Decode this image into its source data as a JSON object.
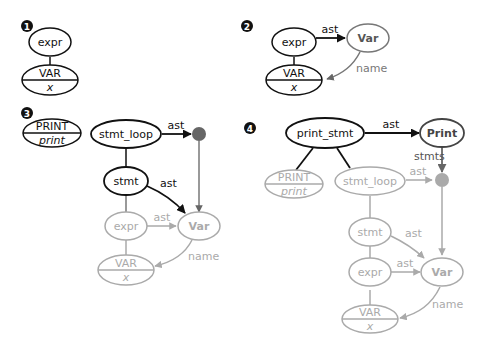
{
  "colors": {
    "black": "#111111",
    "dark_gray": "#666666",
    "light_gray": "#aaaaaa",
    "background": "#ffffff"
  },
  "panels": [
    {
      "step": "1",
      "nodes": [
        {
          "id": "expr",
          "label": "expr"
        },
        {
          "id": "VAR",
          "top": "VAR",
          "bottom": "x"
        }
      ]
    },
    {
      "step": "2",
      "nodes": [
        {
          "id": "expr",
          "label": "expr"
        },
        {
          "id": "Var",
          "label": "Var"
        },
        {
          "id": "VAR",
          "top": "VAR",
          "bottom": "x"
        }
      ],
      "edges": [
        {
          "from": "expr",
          "to": "Var",
          "label": "ast"
        },
        {
          "from": "Var",
          "to": "VAR",
          "label": "name"
        }
      ]
    },
    {
      "step": "3",
      "nodes": [
        {
          "id": "PRINT",
          "top": "PRINT",
          "bottom": "print"
        },
        {
          "id": "stmt_loop",
          "label": "stmt_loop"
        },
        {
          "id": "dot",
          "label": ""
        },
        {
          "id": "stmt",
          "label": "stmt"
        },
        {
          "id": "expr",
          "label": "expr"
        },
        {
          "id": "Var",
          "label": "Var"
        },
        {
          "id": "VAR",
          "top": "VAR",
          "bottom": "x"
        }
      ],
      "edges": [
        {
          "from": "stmt_loop",
          "to": "dot",
          "label": "ast"
        },
        {
          "from": "stmt",
          "to": "Var",
          "label": "ast"
        },
        {
          "from": "expr",
          "to": "Var",
          "label": "ast"
        },
        {
          "from": "Var",
          "to": "VAR",
          "label": "name"
        }
      ]
    },
    {
      "step": "4",
      "nodes": [
        {
          "id": "print_stmt",
          "label": "print_stmt"
        },
        {
          "id": "Print",
          "label": "Print"
        },
        {
          "id": "PRINT",
          "top": "PRINT",
          "bottom": "print"
        },
        {
          "id": "stmt_loop",
          "label": "stmt_loop"
        },
        {
          "id": "dot",
          "label": ""
        },
        {
          "id": "stmt",
          "label": "stmt"
        },
        {
          "id": "expr",
          "label": "expr"
        },
        {
          "id": "Var",
          "label": "Var"
        },
        {
          "id": "VAR",
          "top": "VAR",
          "bottom": "x"
        }
      ],
      "edges": [
        {
          "from": "print_stmt",
          "to": "Print",
          "label": "ast"
        },
        {
          "from": "Print",
          "to": "dot",
          "label": "stmts"
        },
        {
          "from": "stmt_loop",
          "to": "dot",
          "label": "ast"
        },
        {
          "from": "stmt",
          "to": "Var",
          "label": "ast"
        },
        {
          "from": "expr",
          "to": "Var",
          "label": "ast"
        },
        {
          "from": "Var",
          "to": "VAR",
          "label": "name"
        }
      ]
    }
  ]
}
